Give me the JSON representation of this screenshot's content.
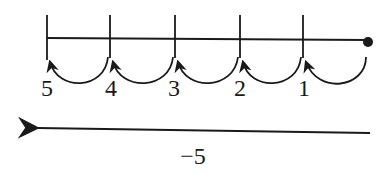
{
  "diagram": {
    "type": "number-line-jumps",
    "ticks": [
      {
        "x": 47,
        "label": "5"
      },
      {
        "x": 110,
        "label": "4"
      },
      {
        "x": 175,
        "label": "3"
      },
      {
        "x": 240,
        "label": "2"
      },
      {
        "x": 303,
        "label": "1"
      }
    ],
    "start_point": {
      "x": 368
    },
    "jumps": [
      {
        "from": 368,
        "to": 306
      },
      {
        "from": 303,
        "to": 243
      },
      {
        "from": 240,
        "to": 178
      },
      {
        "from": 175,
        "to": 113
      },
      {
        "from": 110,
        "to": 50
      }
    ],
    "result_arrow": {
      "label": "−5",
      "direction": "left"
    },
    "colors": {
      "stroke": "#1a1a1a",
      "background": "#ffffff"
    }
  }
}
